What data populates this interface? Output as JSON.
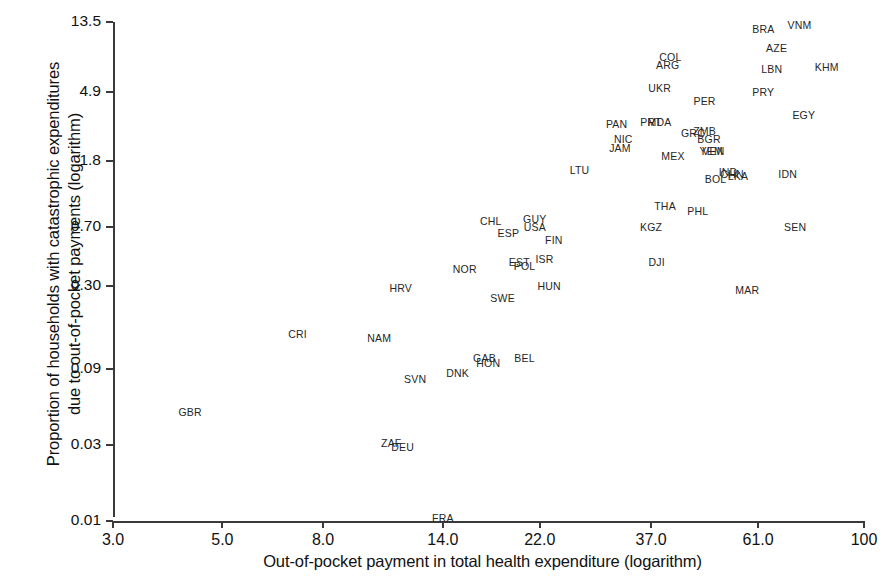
{
  "chart_data": {
    "type": "scatter",
    "title": "",
    "xlabel": "Out-of-pocket payment in total health expenditure (logarithm)",
    "ylabel": "Proportion of households with catastrophic expenditures\ndue to out-of-pocket payments (logarithm)",
    "x_scale": "log",
    "y_scale": "log",
    "grid": false,
    "legend": null,
    "xticks": [
      "3.0",
      "5.0",
      "8.0",
      "14.0",
      "22.0",
      "37.0",
      "61.0",
      "100"
    ],
    "xtick_values": [
      3.0,
      5.0,
      8.0,
      14.0,
      22.0,
      37.0,
      61.0,
      100
    ],
    "yticks": [
      "13.5",
      "4.9",
      "1.8",
      "0.70",
      "0.30",
      "0.09",
      "0.03",
      "0.01"
    ],
    "ytick_values": [
      13.5,
      4.9,
      1.8,
      0.7,
      0.3,
      0.09,
      0.03,
      0.01
    ],
    "xlim": [
      3.0,
      100
    ],
    "ylim": [
      0.01,
      13.5
    ],
    "marker_style": "text-label",
    "points": [
      {
        "label": "VNM",
        "x": 74.0,
        "y": 12.9
      },
      {
        "label": "BRA",
        "x": 62.5,
        "y": 12.2
      },
      {
        "label": "AZE",
        "x": 66.5,
        "y": 9.3
      },
      {
        "label": "COL",
        "x": 40.5,
        "y": 8.2
      },
      {
        "label": "ARG",
        "x": 40.0,
        "y": 7.3
      },
      {
        "label": "KHM",
        "x": 84.0,
        "y": 7.0
      },
      {
        "label": "LBN",
        "x": 65.0,
        "y": 6.8
      },
      {
        "label": "UKR",
        "x": 38.5,
        "y": 5.2
      },
      {
        "label": "PRY",
        "x": 62.5,
        "y": 4.9
      },
      {
        "label": "PER",
        "x": 47.5,
        "y": 4.3
      },
      {
        "label": "EGY",
        "x": 75.5,
        "y": 3.5
      },
      {
        "label": "PRT",
        "x": 37.0,
        "y": 3.2
      },
      {
        "label": "MDA",
        "x": 38.5,
        "y": 3.2
      },
      {
        "label": "PAN",
        "x": 31.5,
        "y": 3.1
      },
      {
        "label": "ZMB",
        "x": 47.5,
        "y": 2.8
      },
      {
        "label": "GRC",
        "x": 45.0,
        "y": 2.7
      },
      {
        "label": "BGR",
        "x": 48.5,
        "y": 2.5
      },
      {
        "label": "NIC",
        "x": 32.5,
        "y": 2.5
      },
      {
        "label": "JAM",
        "x": 32.0,
        "y": 2.2
      },
      {
        "label": "YEM",
        "x": 49.0,
        "y": 2.1
      },
      {
        "label": "VEN",
        "x": 49.5,
        "y": 2.1
      },
      {
        "label": "MEX",
        "x": 41.0,
        "y": 1.95
      },
      {
        "label": "LTU",
        "x": 26.5,
        "y": 1.6
      },
      {
        "label": "IND",
        "x": 53.0,
        "y": 1.55
      },
      {
        "label": "CHN",
        "x": 54.0,
        "y": 1.5
      },
      {
        "label": "LKA",
        "x": 55.5,
        "y": 1.45
      },
      {
        "label": "BOL",
        "x": 50.0,
        "y": 1.4
      },
      {
        "label": "IDN",
        "x": 70.0,
        "y": 1.5
      },
      {
        "label": "THA",
        "x": 39.5,
        "y": 0.95
      },
      {
        "label": "PHL",
        "x": 46.0,
        "y": 0.88
      },
      {
        "label": "SEN",
        "x": 72.5,
        "y": 0.7
      },
      {
        "label": "KGZ",
        "x": 37.0,
        "y": 0.7
      },
      {
        "label": "CHL",
        "x": 17.5,
        "y": 0.76
      },
      {
        "label": "GUY",
        "x": 21.5,
        "y": 0.78
      },
      {
        "label": "USA",
        "x": 21.5,
        "y": 0.7
      },
      {
        "label": "ESP",
        "x": 19.0,
        "y": 0.64
      },
      {
        "label": "FIN",
        "x": 23.5,
        "y": 0.58
      },
      {
        "label": "ISR",
        "x": 22.5,
        "y": 0.44
      },
      {
        "label": "EST",
        "x": 20.0,
        "y": 0.42
      },
      {
        "label": "POL",
        "x": 20.5,
        "y": 0.4
      },
      {
        "label": "DJI",
        "x": 38.0,
        "y": 0.42
      },
      {
        "label": "NOR",
        "x": 15.5,
        "y": 0.38
      },
      {
        "label": "HUN",
        "x": 23.0,
        "y": 0.3
      },
      {
        "label": "MAR",
        "x": 58.0,
        "y": 0.28
      },
      {
        "label": "HRV",
        "x": 11.5,
        "y": 0.29
      },
      {
        "label": "SWE",
        "x": 18.5,
        "y": 0.25
      },
      {
        "label": "CRI",
        "x": 7.1,
        "y": 0.15
      },
      {
        "label": "NAM",
        "x": 10.4,
        "y": 0.14
      },
      {
        "label": "GAB",
        "x": 17.0,
        "y": 0.105
      },
      {
        "label": "HON",
        "x": 17.3,
        "y": 0.098
      },
      {
        "label": "BEL",
        "x": 20.5,
        "y": 0.105
      },
      {
        "label": "DNK",
        "x": 15.0,
        "y": 0.085
      },
      {
        "label": "SVN",
        "x": 12.3,
        "y": 0.078
      },
      {
        "label": "GBR",
        "x": 4.3,
        "y": 0.048
      },
      {
        "label": "ZAF",
        "x": 11.0,
        "y": 0.031
      },
      {
        "label": "DEU",
        "x": 11.6,
        "y": 0.029
      },
      {
        "label": "FRA",
        "x": 14.0,
        "y": 0.0105
      }
    ]
  }
}
